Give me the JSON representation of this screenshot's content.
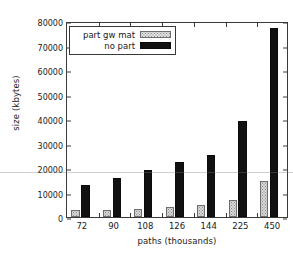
{
  "chart_data": {
    "type": "bar",
    "title": "",
    "xlabel": "paths (thousands)",
    "ylabel": "size (kbytes)",
    "categories": [
      "72",
      "90",
      "108",
      "126",
      "144",
      "225",
      "450"
    ],
    "series": [
      {
        "name": "part gw mat",
        "style": "dotted-light",
        "values": [
          2700,
          3000,
          3500,
          4000,
          4800,
          7200,
          14700
        ]
      },
      {
        "name": "no part",
        "style": "solid-black",
        "values": [
          13200,
          16000,
          19500,
          22500,
          25600,
          39600,
          78000
        ]
      }
    ],
    "ylim": [
      0,
      80000
    ],
    "yticks": [
      0,
      10000,
      20000,
      30000,
      40000,
      50000,
      60000,
      70000,
      80000
    ],
    "ytick_labels": [
      "0",
      "10000",
      "20000",
      "30000",
      "40000",
      "50000",
      "60000",
      "70000",
      "80000"
    ],
    "grid": false,
    "legend_position": "top-left-inside",
    "colors": {
      "series_light_fill": "#d8d8d8",
      "series_light_pattern": "#8a8a8a",
      "series_dark_fill": "#111111",
      "axis": "#3a3a3a",
      "background": "#ffffff",
      "text": "#1a1a1a"
    }
  },
  "legend": {
    "entries": [
      {
        "label": "part gw mat",
        "swatch": "light"
      },
      {
        "label": "no part",
        "swatch": "dark"
      }
    ]
  }
}
